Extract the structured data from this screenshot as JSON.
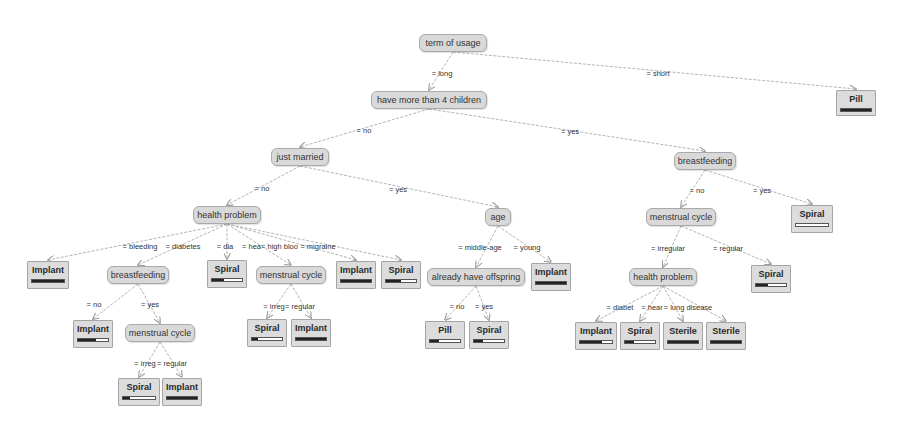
{
  "diagram": {
    "type": "decision-tree",
    "colors": {
      "node_fill": "#d9d9d9",
      "node_border": "#a9a9a9",
      "edge": "#b5b5b5",
      "bar_fill": "#222222"
    },
    "nodes": [
      {
        "id": "root",
        "label": "term of usage",
        "kind": "split",
        "x": 419,
        "y": 34,
        "w": 68,
        "h": 18
      },
      {
        "id": "n_children",
        "label": "have more than 4 children",
        "kind": "split",
        "x": 371,
        "y": 91,
        "w": 116,
        "h": 18
      },
      {
        "id": "pill_short",
        "label": "Pill",
        "kind": "leaf",
        "x": 836,
        "y": 90,
        "w": 40,
        "h": 26,
        "fill": 1.0
      },
      {
        "id": "just_married",
        "label": "just married",
        "kind": "split",
        "x": 271,
        "y": 148,
        "w": 58,
        "h": 18
      },
      {
        "id": "bf_yes",
        "label": "breastfeeding",
        "kind": "split",
        "x": 674,
        "y": 152,
        "w": 62,
        "h": 18
      },
      {
        "id": "hp_left",
        "label": "health problem",
        "kind": "split",
        "x": 193,
        "y": 206,
        "w": 68,
        "h": 18
      },
      {
        "id": "age",
        "label": "age",
        "kind": "split",
        "x": 485,
        "y": 208,
        "w": 26,
        "h": 18
      },
      {
        "id": "mc_right",
        "label": "menstrual cycle",
        "kind": "split",
        "x": 646,
        "y": 208,
        "w": 70,
        "h": 18
      },
      {
        "id": "spiral_bf",
        "label": "Spiral",
        "kind": "leaf",
        "x": 791,
        "y": 205,
        "w": 42,
        "h": 28,
        "fill": 0.0
      },
      {
        "id": "implant_bleed",
        "label": "Implant",
        "kind": "leaf",
        "x": 27,
        "y": 261,
        "w": 42,
        "h": 28,
        "fill": 1.0
      },
      {
        "id": "bf_diab",
        "label": "breastfeeding",
        "kind": "split",
        "x": 107,
        "y": 266,
        "w": 62,
        "h": 18
      },
      {
        "id": "spiral_dia",
        "label": "Spiral",
        "kind": "leaf",
        "x": 207,
        "y": 260,
        "w": 40,
        "h": 28,
        "fill": 0.4
      },
      {
        "id": "mc_high",
        "label": "menstrual cycle",
        "kind": "split",
        "x": 256,
        "y": 266,
        "w": 70,
        "h": 18
      },
      {
        "id": "implant_mig",
        "label": "Implant",
        "kind": "leaf",
        "x": 336,
        "y": 261,
        "w": 40,
        "h": 28,
        "fill": 1.0
      },
      {
        "id": "spiral_mig",
        "label": "Spiral",
        "kind": "leaf",
        "x": 381,
        "y": 261,
        "w": 40,
        "h": 28,
        "fill": 0.5
      },
      {
        "id": "offspring",
        "label": "already have offspring",
        "kind": "split",
        "x": 427,
        "y": 268,
        "w": 98,
        "h": 18
      },
      {
        "id": "implant_young",
        "label": "Implant",
        "kind": "leaf",
        "x": 531,
        "y": 263,
        "w": 40,
        "h": 28,
        "fill": 1.0
      },
      {
        "id": "hp_right",
        "label": "health problem",
        "kind": "split",
        "x": 629,
        "y": 268,
        "w": 68,
        "h": 18
      },
      {
        "id": "spiral_reg",
        "label": "Spiral",
        "kind": "leaf",
        "x": 751,
        "y": 265,
        "w": 40,
        "h": 28,
        "fill": 0.4
      },
      {
        "id": "implant_no",
        "label": "Implant",
        "kind": "leaf",
        "x": 73,
        "y": 320,
        "w": 40,
        "h": 28,
        "fill": 0.6
      },
      {
        "id": "mc_yes",
        "label": "menstrual cycle",
        "kind": "split",
        "x": 125,
        "y": 324,
        "w": 70,
        "h": 18
      },
      {
        "id": "spiral_irreg1",
        "label": "Spiral",
        "kind": "leaf",
        "x": 247,
        "y": 319,
        "w": 40,
        "h": 28,
        "fill": 0.2
      },
      {
        "id": "implant_reg1",
        "label": "Implant",
        "kind": "leaf",
        "x": 291,
        "y": 319,
        "w": 40,
        "h": 28,
        "fill": 1.0
      },
      {
        "id": "pill_no",
        "label": "Pill",
        "kind": "leaf",
        "x": 425,
        "y": 321,
        "w": 40,
        "h": 28,
        "fill": 0.3
      },
      {
        "id": "spiral_yes",
        "label": "Spiral",
        "kind": "leaf",
        "x": 469,
        "y": 321,
        "w": 40,
        "h": 28,
        "fill": 0.3
      },
      {
        "id": "implant_diab",
        "label": "Implant",
        "kind": "leaf",
        "x": 575,
        "y": 322,
        "w": 42,
        "h": 28,
        "fill": 0.7
      },
      {
        "id": "spiral_heart",
        "label": "Spiral",
        "kind": "leaf",
        "x": 620,
        "y": 322,
        "w": 40,
        "h": 28,
        "fill": 0.3
      },
      {
        "id": "sterile_lung",
        "label": "Sterile",
        "kind": "leaf",
        "x": 663,
        "y": 322,
        "w": 40,
        "h": 28,
        "fill": 1.0
      },
      {
        "id": "sterile_other",
        "label": "Sterile",
        "kind": "leaf",
        "x": 706,
        "y": 322,
        "w": 40,
        "h": 28,
        "fill": 1.0
      },
      {
        "id": "spiral_irreg2",
        "label": "Spiral",
        "kind": "leaf",
        "x": 118,
        "y": 378,
        "w": 42,
        "h": 28,
        "fill": 0.2
      },
      {
        "id": "implant_reg2",
        "label": "Implant",
        "kind": "leaf",
        "x": 162,
        "y": 378,
        "w": 40,
        "h": 28,
        "fill": 1.0
      }
    ],
    "edges": [
      {
        "from": "root",
        "to": "n_children",
        "label": "= long",
        "lx": 442,
        "ly": 73
      },
      {
        "from": "root",
        "to": "pill_short",
        "label": "= short",
        "lx": 658,
        "ly": 73
      },
      {
        "from": "n_children",
        "to": "just_married",
        "label": "= no",
        "lx": 364,
        "ly": 130
      },
      {
        "from": "n_children",
        "to": "bf_yes",
        "label": "= yes",
        "lx": 570,
        "ly": 131
      },
      {
        "from": "just_married",
        "to": "hp_left",
        "label": "= no",
        "lx": 262,
        "ly": 188
      },
      {
        "from": "just_married",
        "to": "age",
        "label": "= yes",
        "lx": 398,
        "ly": 189
      },
      {
        "from": "bf_yes",
        "to": "mc_right",
        "label": "= no",
        "lx": 697,
        "ly": 190
      },
      {
        "from": "bf_yes",
        "to": "spiral_bf",
        "label": "= yes",
        "lx": 762,
        "ly": 190
      },
      {
        "from": "hp_left",
        "to": "implant_bleed",
        "label": "= bleeding",
        "lx": 140,
        "ly": 246
      },
      {
        "from": "hp_left",
        "to": "bf_diab",
        "label": "= diabetes",
        "lx": 183,
        "ly": 246
      },
      {
        "from": "hp_left",
        "to": "spiral_dia",
        "label": "= dia",
        "lx": 225,
        "ly": 246
      },
      {
        "from": "hp_left",
        "to": "mc_high",
        "label": "= hea= high bloo",
        "lx": 270,
        "ly": 246
      },
      {
        "from": "hp_left",
        "to": "implant_mig",
        "label": "= migraine",
        "lx": 318,
        "ly": 246
      },
      {
        "from": "hp_left",
        "to": "spiral_mig",
        "label": "",
        "lx": 0,
        "ly": 0
      },
      {
        "from": "age",
        "to": "offspring",
        "label": "= middle-age",
        "lx": 480,
        "ly": 247
      },
      {
        "from": "age",
        "to": "implant_young",
        "label": "= young",
        "lx": 527,
        "ly": 247
      },
      {
        "from": "mc_right",
        "to": "hp_right",
        "label": "= irregular",
        "lx": 668,
        "ly": 248
      },
      {
        "from": "mc_right",
        "to": "spiral_reg",
        "label": "= regular",
        "lx": 728,
        "ly": 248
      },
      {
        "from": "bf_diab",
        "to": "implant_no",
        "label": "= no",
        "lx": 94,
        "ly": 304
      },
      {
        "from": "bf_diab",
        "to": "mc_yes",
        "label": "= yes",
        "lx": 150,
        "ly": 304
      },
      {
        "from": "mc_high",
        "to": "spiral_irreg1",
        "label": "= irreg",
        "lx": 274,
        "ly": 306
      },
      {
        "from": "mc_high",
        "to": "implant_reg1",
        "label": "= regular",
        "lx": 300,
        "ly": 306
      },
      {
        "from": "offspring",
        "to": "pill_no",
        "label": "= no",
        "lx": 457,
        "ly": 306
      },
      {
        "from": "offspring",
        "to": "spiral_yes",
        "label": "= yes",
        "lx": 484,
        "ly": 306
      },
      {
        "from": "hp_right",
        "to": "implant_diab",
        "label": "= diabet",
        "lx": 620,
        "ly": 307
      },
      {
        "from": "hp_right",
        "to": "spiral_heart",
        "label": "= hear",
        "lx": 652,
        "ly": 307
      },
      {
        "from": "hp_right",
        "to": "sterile_lung",
        "label": "= lung disease",
        "lx": 688,
        "ly": 307
      },
      {
        "from": "hp_right",
        "to": "sterile_other",
        "label": "",
        "lx": 0,
        "ly": 0
      },
      {
        "from": "mc_yes",
        "to": "spiral_irreg2",
        "label": "= irreg",
        "lx": 145,
        "ly": 363
      },
      {
        "from": "mc_yes",
        "to": "implant_reg2",
        "label": "= regular",
        "lx": 172,
        "ly": 363
      }
    ]
  }
}
